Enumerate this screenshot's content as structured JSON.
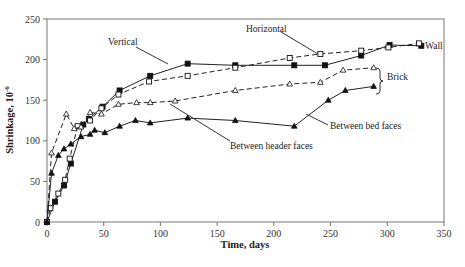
{
  "chart_data": {
    "type": "line",
    "title": "",
    "xlabel": "Time, days",
    "ylabel": "Shrinkage, 10⁻⁶",
    "xlim": [
      0,
      350
    ],
    "ylim": [
      0,
      250
    ],
    "xticks": [
      0,
      50,
      100,
      150,
      200,
      250,
      300,
      350
    ],
    "yticks": [
      0,
      50,
      100,
      150,
      200,
      250
    ],
    "grid": false,
    "legend": "annotations",
    "series": [
      {
        "name": "Vertical",
        "group": "Wall",
        "marker": "filled-square",
        "line": "solid",
        "points": [
          [
            0,
            0
          ],
          [
            7,
            25
          ],
          [
            15,
            45
          ],
          [
            21,
            72
          ],
          [
            32,
            120
          ],
          [
            37,
            127
          ],
          [
            49,
            142
          ],
          [
            64,
            162
          ],
          [
            91,
            180
          ],
          [
            124,
            195
          ],
          [
            166,
            193
          ],
          [
            218,
            193
          ],
          [
            245,
            193
          ],
          [
            277,
            205
          ],
          [
            302,
            218
          ],
          [
            330,
            217
          ]
        ]
      },
      {
        "name": "Horizontal",
        "group": "Wall",
        "marker": "open-square",
        "line": "dashed",
        "points": [
          [
            0,
            0
          ],
          [
            3,
            17
          ],
          [
            10,
            35
          ],
          [
            16,
            52
          ],
          [
            20,
            78
          ],
          [
            27,
            118
          ],
          [
            38,
            125
          ],
          [
            48,
            140
          ],
          [
            63,
            157
          ],
          [
            90,
            173
          ],
          [
            124,
            180
          ],
          [
            166,
            190
          ],
          [
            214,
            202
          ],
          [
            241,
            207
          ],
          [
            277,
            211
          ],
          [
            301,
            215
          ],
          [
            328,
            220
          ]
        ]
      },
      {
        "name": "Between header faces",
        "group": "Brick",
        "marker": "open-triangle",
        "line": "dashed",
        "points": [
          [
            0,
            0
          ],
          [
            4,
            85
          ],
          [
            17,
            133
          ],
          [
            24,
            115
          ],
          [
            30,
            117
          ],
          [
            38,
            135
          ],
          [
            48,
            133
          ],
          [
            63,
            145
          ],
          [
            79,
            147
          ],
          [
            91,
            147
          ],
          [
            113,
            149
          ],
          [
            166,
            162
          ],
          [
            214,
            170
          ],
          [
            241,
            172
          ],
          [
            261,
            187
          ],
          [
            288,
            190
          ]
        ]
      },
      {
        "name": "Between bed faces",
        "group": "Brick",
        "marker": "filled-triangle",
        "line": "solid",
        "points": [
          [
            0,
            0
          ],
          [
            4,
            60
          ],
          [
            10,
            82
          ],
          [
            15,
            90
          ],
          [
            21,
            96
          ],
          [
            30,
            105
          ],
          [
            38,
            108
          ],
          [
            42,
            113
          ],
          [
            51,
            110
          ],
          [
            64,
            118
          ],
          [
            78,
            125
          ],
          [
            91,
            122
          ],
          [
            124,
            128
          ],
          [
            166,
            125
          ],
          [
            218,
            118
          ],
          [
            248,
            150
          ],
          [
            263,
            162
          ],
          [
            288,
            167
          ]
        ]
      }
    ],
    "annotations": [
      {
        "text": "Vertical",
        "x": 96,
        "y": 53
      },
      {
        "text": "Horizontal",
        "x": 248,
        "y": 31
      },
      {
        "text": "Wall",
        "x": 424,
        "y": 47
      },
      {
        "text": "Brick",
        "x": 386,
        "y": 80
      },
      {
        "text": "Between bed faces",
        "x": 330,
        "y": 129
      },
      {
        "text": "Between header faces",
        "x": 232,
        "y": 148
      }
    ]
  },
  "labels": {
    "xlabel": "Time, days",
    "ylabel": "Shrinkage, 10",
    "ylabel_exp": "-6",
    "vertical": "Vertical",
    "horizontal": "Horizontal",
    "wall": "Wall",
    "brick": "Brick",
    "bed": "Between bed faces",
    "header": "Between header faces"
  }
}
